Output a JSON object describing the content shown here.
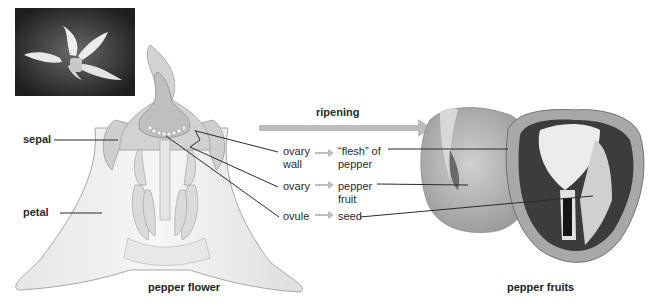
{
  "diagram": {
    "photo_inset": {
      "subject": "pepper flower photo"
    },
    "flower": {
      "caption": "pepper flower",
      "labels": {
        "sepal": "sepal",
        "petal": "petal"
      }
    },
    "process": {
      "arrow_label": "ripening",
      "mappings": [
        {
          "from_line1": "ovary",
          "from_line2": "wall",
          "to_line1": "“flesh” of",
          "to_line2": "pepper"
        },
        {
          "from_line1": "ovary",
          "from_line2": "",
          "to_line1": "pepper",
          "to_line2": "fruit"
        },
        {
          "from_line1": "ovule",
          "from_line2": "",
          "to_line1": "seed",
          "to_line2": ""
        }
      ]
    },
    "fruit": {
      "caption": "pepper fruits"
    },
    "colors": {
      "background": "#ffffff",
      "flower_fill": "#d8d8d8",
      "ovary_fill": "#c4c4c4",
      "arrow": "#bdbdbd",
      "leader_line": "#2b2b2b",
      "pepper_skin": "#b8b8b8",
      "pepper_cavity": "#3a3a3a"
    }
  }
}
